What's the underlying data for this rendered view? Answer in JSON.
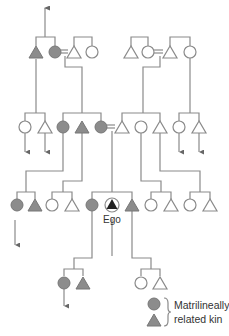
{
  "diagram": {
    "type": "kinship-chart",
    "ego_label": "Ego",
    "legend": {
      "line1": "Matrilineally",
      "line2": "related kin"
    },
    "colors": {
      "matrilineal_fill": "#8c8c8c",
      "line": "#8a8a8a",
      "open_fill": "#ffffff"
    },
    "symbols": {
      "female": "circle",
      "male": "triangle",
      "marriage": "=",
      "matrilineal": "filled gray"
    },
    "generations": [
      {
        "row": 1,
        "members": [
          {
            "sex": "male",
            "matrilineal": true
          },
          {
            "sex": "female",
            "matrilineal": true,
            "married_to_next": true
          },
          {
            "sex": "male",
            "matrilineal": false
          },
          {
            "sex": "female",
            "matrilineal": false
          },
          {
            "sex": "male",
            "matrilineal": false
          },
          {
            "sex": "female",
            "matrilineal": false,
            "married_to_next": true
          },
          {
            "sex": "male",
            "matrilineal": false
          },
          {
            "sex": "female",
            "matrilineal": false
          }
        ]
      },
      {
        "row": 2,
        "members": [
          {
            "sex": "female",
            "matrilineal": false
          },
          {
            "sex": "male",
            "matrilineal": false
          },
          {
            "sex": "female",
            "matrilineal": true
          },
          {
            "sex": "male",
            "matrilineal": true
          },
          {
            "sex": "female",
            "matrilineal": true,
            "married_to_next": true
          },
          {
            "sex": "male",
            "matrilineal": false
          },
          {
            "sex": "female",
            "matrilineal": false
          },
          {
            "sex": "male",
            "matrilineal": false
          },
          {
            "sex": "female",
            "matrilineal": false
          },
          {
            "sex": "male",
            "matrilineal": false
          }
        ]
      },
      {
        "row": 3,
        "members": [
          {
            "sex": "female",
            "matrilineal": true
          },
          {
            "sex": "male",
            "matrilineal": true
          },
          {
            "sex": "female",
            "matrilineal": false
          },
          {
            "sex": "male",
            "matrilineal": false
          },
          {
            "sex": "female",
            "matrilineal": true
          },
          {
            "sex": "male",
            "matrilineal": true,
            "ego": true
          },
          {
            "sex": "male",
            "matrilineal": true
          },
          {
            "sex": "female",
            "matrilineal": false
          },
          {
            "sex": "male",
            "matrilineal": false
          },
          {
            "sex": "female",
            "matrilineal": false
          },
          {
            "sex": "male",
            "matrilineal": false
          }
        ]
      },
      {
        "row": 4,
        "members": [
          {
            "sex": "female",
            "matrilineal": true
          },
          {
            "sex": "male",
            "matrilineal": true
          },
          {
            "sex": "female",
            "matrilineal": false
          },
          {
            "sex": "male",
            "matrilineal": false
          }
        ]
      }
    ]
  }
}
